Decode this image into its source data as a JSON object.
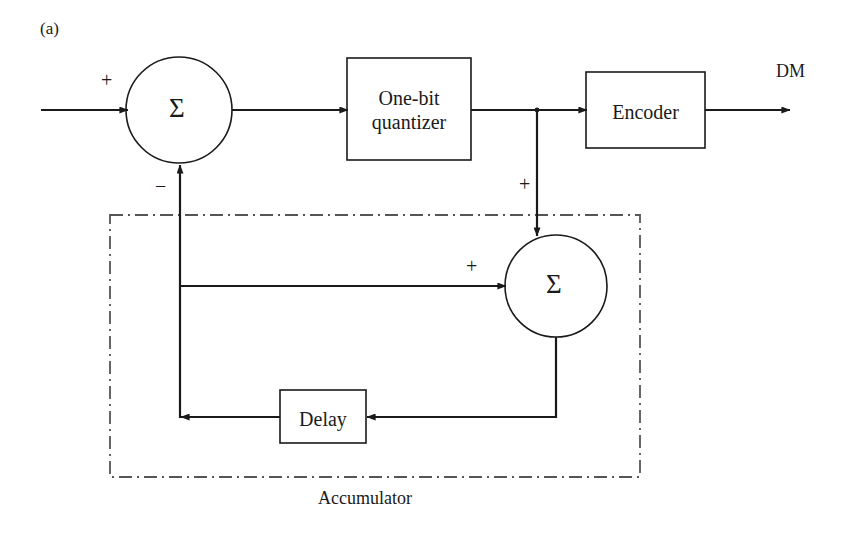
{
  "figure": {
    "panel_tag": "(a)",
    "caption": "Accumulator",
    "output_label": "DM"
  },
  "blocks": [
    {
      "id": "quantizer",
      "label_line1": "One-bit",
      "label_line2": "quantizer",
      "shape": "rect"
    },
    {
      "id": "encoder",
      "label_line1": "Encoder",
      "label_line2": "",
      "shape": "rect"
    },
    {
      "id": "delay",
      "label_line1": "Delay",
      "label_line2": "",
      "shape": "rect"
    }
  ],
  "summing_nodes": [
    {
      "id": "sum-top",
      "symbol": "Σ",
      "input_signs": [
        "+",
        "−"
      ]
    },
    {
      "id": "sum-bottom",
      "symbol": "Σ",
      "input_signs": [
        "+",
        "+"
      ]
    }
  ],
  "signs": {
    "top_sum_plus": "+",
    "top_sum_minus": "−",
    "bottom_sum_plus_left": "+",
    "bottom_sum_plus_top": "+"
  },
  "colors": {
    "stroke": "#1a1a1a",
    "dashdot": "#555555",
    "background": "#ffffff",
    "text": "#1a1a1a"
  },
  "grouping_box": {
    "style": "dash-dot",
    "label": "Accumulator"
  }
}
